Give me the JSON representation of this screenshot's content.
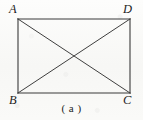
{
  "figure": {
    "caption": "( a )",
    "background_color": "#fbfbfa",
    "stroke_color": "#3a3a3a",
    "shape": {
      "type": "rectangle-with-diagonals",
      "vertices": [
        {
          "id": "A",
          "label": "A",
          "position": "top-left",
          "x": 18,
          "y": 19
        },
        {
          "id": "D",
          "label": "D",
          "position": "top-right",
          "x": 130,
          "y": 19
        },
        {
          "id": "B",
          "label": "B",
          "position": "bottom-left",
          "x": 18,
          "y": 93
        },
        {
          "id": "C",
          "label": "C",
          "position": "bottom-right",
          "x": 130,
          "y": 93
        }
      ],
      "edges": [
        {
          "id": "AD",
          "from": "A",
          "to": "D"
        },
        {
          "id": "DC",
          "from": "D",
          "to": "C"
        },
        {
          "id": "CB",
          "from": "C",
          "to": "B"
        },
        {
          "id": "BA",
          "from": "B",
          "to": "A"
        }
      ],
      "diagonals": [
        {
          "id": "AC",
          "from": "A",
          "to": "C"
        },
        {
          "id": "BD",
          "from": "B",
          "to": "D"
        }
      ],
      "intersection": {
        "id": "O",
        "x": 74,
        "y": 56
      }
    }
  }
}
